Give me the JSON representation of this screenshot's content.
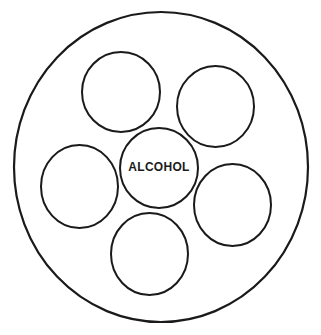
{
  "diagram": {
    "type": "circle-diagram",
    "style": {
      "stroke_color": "#1a1a1a",
      "background": "#ffffff"
    },
    "outer_circle": {
      "cx": 161,
      "cy": 167,
      "rx": 147,
      "ry": 155,
      "stroke_width": 2.2
    },
    "center_circle": {
      "cx": 159,
      "cy": 168,
      "rx": 39,
      "ry": 40,
      "label": "ALCOHOL"
    },
    "satellite_circles": [
      {
        "id": "top-left",
        "cx": 121,
        "cy": 92,
        "rx": 39,
        "ry": 40,
        "label": ""
      },
      {
        "id": "top-right",
        "cx": 215.5,
        "cy": 106.5,
        "rx": 38.5,
        "ry": 40.5,
        "label": ""
      },
      {
        "id": "left",
        "cx": 79.5,
        "cy": 186.5,
        "rx": 38.5,
        "ry": 41.5,
        "label": ""
      },
      {
        "id": "right",
        "cx": 232.5,
        "cy": 205,
        "rx": 38.5,
        "ry": 41,
        "label": ""
      },
      {
        "id": "bottom",
        "cx": 149.5,
        "cy": 254,
        "rx": 38.5,
        "ry": 41,
        "label": ""
      }
    ]
  }
}
